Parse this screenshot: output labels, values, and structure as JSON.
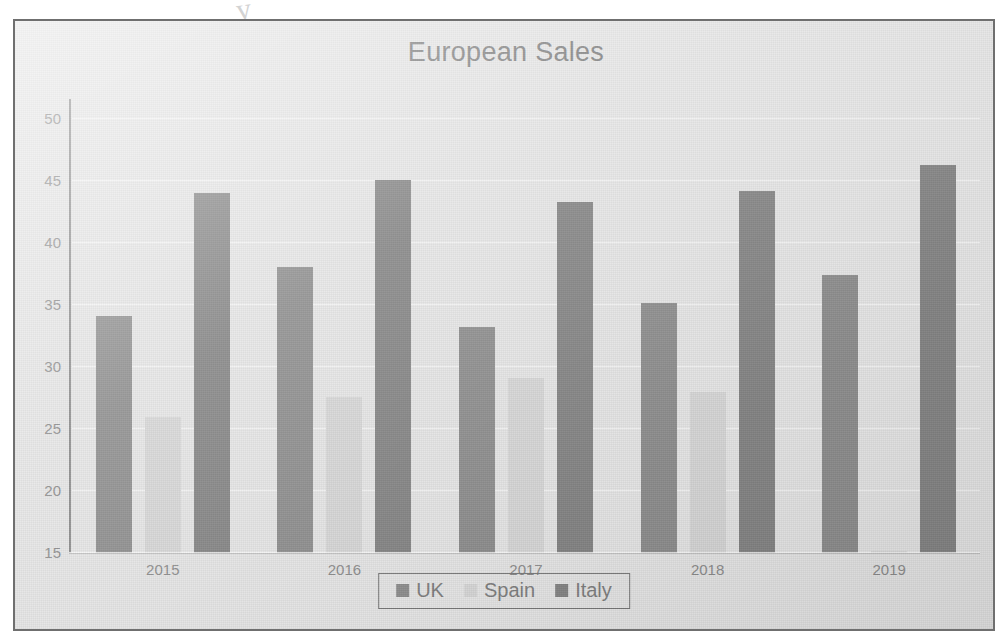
{
  "page": {
    "ink_artifact": "y"
  },
  "chart": {
    "title": "European Sales",
    "legend": {
      "position": "bottom",
      "items": [
        {
          "label": "UK",
          "color": "#8e8e8e",
          "swatch": "square-swatch"
        },
        {
          "label": "Spain",
          "color": "#d8d8d8",
          "swatch": "square-swatch"
        },
        {
          "label": "Italy",
          "color": "#858585",
          "swatch": "square-swatch"
        }
      ]
    }
  },
  "chart_data": {
    "type": "bar",
    "title": "European Sales",
    "xlabel": "",
    "ylabel": "",
    "categories": [
      "2015",
      "2016",
      "2017",
      "2018",
      "2019"
    ],
    "series": [
      {
        "name": "UK",
        "color": "#8e8e8e",
        "values": [
          34.1,
          38.1,
          33.2,
          35.2,
          37.4
        ]
      },
      {
        "name": "Spain",
        "color": "#d8d8d8",
        "values": [
          26.0,
          27.6,
          29.1,
          28.0,
          15.2
        ]
      },
      {
        "name": "Italy",
        "color": "#858585",
        "values": [
          44.0,
          45.1,
          43.3,
          44.2,
          46.3
        ]
      }
    ],
    "ylim": [
      15,
      50
    ],
    "ytick_labels": [
      "50",
      "45",
      "40",
      "35",
      "30",
      "25",
      "20",
      "15"
    ],
    "ytick_values": [
      50,
      45,
      40,
      35,
      30,
      25,
      20,
      15
    ],
    "ytick_step": 5,
    "grid": true,
    "grid_axis": "y",
    "legend_position": "bottom",
    "bar_grouping": "clustered"
  }
}
